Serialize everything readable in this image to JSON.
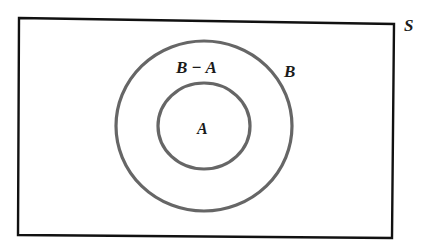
{
  "diagram": {
    "type": "venn",
    "title": "",
    "universe": {
      "label": "S",
      "description": "Sample space rectangle"
    },
    "sets": [
      {
        "id": "B",
        "label": "B",
        "relation": "outer circle",
        "contains": [
          "A"
        ]
      },
      {
        "id": "A",
        "label": "A",
        "relation": "inner circle",
        "subset_of": "B"
      }
    ],
    "regions": [
      {
        "id": "B_minus_A",
        "label": "B − A",
        "description": "Ring between circle B and circle A"
      },
      {
        "id": "A",
        "label": "A",
        "description": "Interior of inner circle"
      }
    ],
    "labels": {
      "universe": "S",
      "outer_set": "B",
      "inner_set": "A",
      "difference_region": "B − A"
    },
    "colors": {
      "rectangle_stroke": "#111111",
      "circle_stroke": "#666666",
      "text": "#1a1a1a",
      "background": "#ffffff"
    }
  }
}
